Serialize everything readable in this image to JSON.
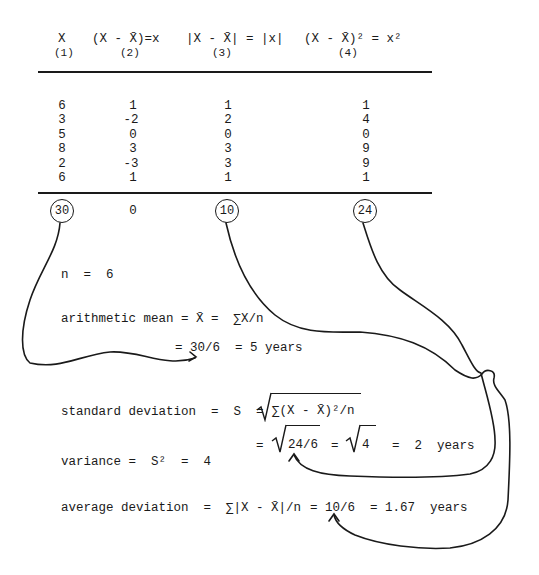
{
  "table": {
    "headers": [
      {
        "expr": "X",
        "num": "(1)"
      },
      {
        "expr": "(X - X̄)=x",
        "num": "(2)"
      },
      {
        "expr": "|X - X̄| = |x|",
        "num": "(3)"
      },
      {
        "expr": "(X - X̄)² = x²",
        "num": "(4)"
      }
    ],
    "rows": [
      [
        "6",
        "1",
        "1",
        "1"
      ],
      [
        "3",
        "-2",
        "2",
        "4"
      ],
      [
        "5",
        "0",
        "0",
        "0"
      ],
      [
        "8",
        "3",
        "3",
        "9"
      ],
      [
        "2",
        "-3",
        "3",
        "9"
      ],
      [
        "6",
        "1",
        "1",
        "1"
      ]
    ],
    "totals": [
      "30",
      "0",
      "10",
      "24"
    ],
    "circled_totals": [
      "30",
      "10",
      "24"
    ]
  },
  "formulas": {
    "n": "n  =  6",
    "mean_line1": "arithmetic mean = X̄ =  ∑X/n",
    "mean_line2": "= 30/6  = 5 years",
    "sd_label": "standard deviation  =  S  =",
    "sd_formula": "∑(X - X̄)²/n",
    "sd_line2_eq": "=",
    "sd_line2_sqrt1": "24/6",
    "sd_line2_eq2": "=",
    "sd_line2_sqrt2": "4",
    "sd_line2_result": "=  2  years",
    "variance": "variance =  S²  =  4",
    "avgdev_label": "average deviation  =",
    "avgdev_formula": "∑|X - X̄|/n",
    "avgdev_result": "= 10/6  = 1.67  years"
  },
  "style": {
    "ink": "#1a1a1a",
    "paper": "#ffffff"
  }
}
